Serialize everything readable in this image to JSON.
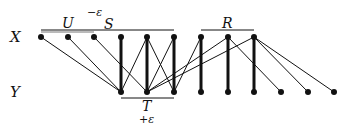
{
  "diagram": {
    "row_labels": {
      "top": "X",
      "bottom": "Y"
    },
    "set_labels": {
      "U": "U",
      "S": "S",
      "R": "R",
      "T": "T",
      "minus_eps": "−ε",
      "plus_eps": "+ε"
    },
    "top_nodes_x": [
      41,
      68,
      94,
      121,
      147,
      174,
      201,
      228,
      254
    ],
    "bottom_nodes_x": [
      121,
      147,
      174,
      201,
      228,
      254,
      281,
      308,
      334
    ],
    "top_y": 37,
    "bottom_y": 92,
    "thick_edges": [
      [
        3,
        0
      ],
      [
        4,
        1
      ],
      [
        5,
        2
      ],
      [
        6,
        3
      ],
      [
        7,
        4
      ],
      [
        8,
        5
      ]
    ],
    "thin_edges": [
      [
        0,
        0
      ],
      [
        1,
        0
      ],
      [
        2,
        1
      ],
      [
        4,
        0
      ],
      [
        4,
        2
      ],
      [
        5,
        1
      ],
      [
        6,
        2
      ],
      [
        7,
        1
      ],
      [
        7,
        6
      ],
      [
        8,
        1
      ],
      [
        8,
        7
      ],
      [
        8,
        8
      ]
    ],
    "brackets": {
      "U": [
        41,
        94,
        32
      ],
      "S": [
        41,
        174,
        30
      ],
      "R": [
        201,
        254,
        30
      ],
      "T": [
        121,
        174,
        98
      ]
    },
    "color": "#111111"
  }
}
